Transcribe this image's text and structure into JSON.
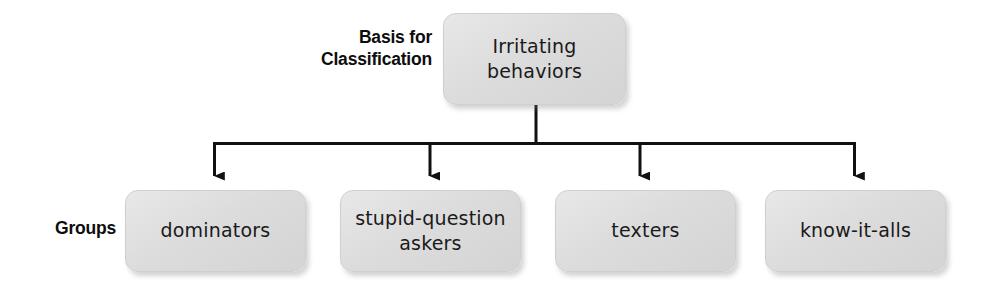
{
  "diagram": {
    "type": "classification-tree",
    "orientation": "top-down",
    "line_color": "#111111",
    "box_fill": "#dcdcdc",
    "box_border": "#cfcfcf",
    "text_color": "#1a1a1a",
    "labels": {
      "basis": "Basis for\nClassification",
      "groups": "Groups"
    },
    "root": {
      "id": "irritating-behaviors",
      "text": "Irritating\nbehaviors"
    },
    "groups": [
      {
        "id": "dominators",
        "text": "dominators"
      },
      {
        "id": "stupid-question-askers",
        "text": "stupid-question\naskers"
      },
      {
        "id": "texters",
        "text": "texters"
      },
      {
        "id": "know-it-alls",
        "text": "know-it-alls"
      }
    ]
  }
}
